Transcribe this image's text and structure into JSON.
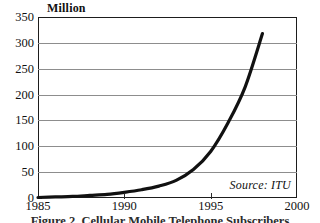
{
  "figure": {
    "unit_label": "Million",
    "source_note": "Source: ITU",
    "caption": "Figure 2. Cellular Mobile Telephone Subscribers"
  },
  "chart_data": {
    "type": "line",
    "title": "",
    "subtitle": "",
    "xlabel": "",
    "ylabel": "Million",
    "xlim": [
      1985,
      2000
    ],
    "ylim": [
      0,
      350
    ],
    "grid": true,
    "legend_position": "none",
    "annotations": [
      "Source: ITU"
    ],
    "x_ticks": [
      1985,
      1990,
      1995,
      2000
    ],
    "x_tick_labels": [
      "1985",
      "1990",
      "1995",
      "2000"
    ],
    "y_ticks": [
      0,
      50,
      100,
      150,
      200,
      250,
      300,
      350
    ],
    "y_tick_labels": [
      "0",
      "50",
      "100",
      "150",
      "200",
      "250",
      "300",
      "350"
    ],
    "series": [
      {
        "name": "Cellular mobile subscribers",
        "color": "#111111",
        "line_width": 3.2,
        "x": [
          1985,
          1986,
          1987,
          1988,
          1989,
          1990,
          1991,
          1992,
          1993,
          1994,
          1995,
          1996,
          1997,
          1998
        ],
        "values": [
          1,
          2,
          3,
          5,
          7,
          11,
          16,
          23,
          34,
          55,
          90,
          145,
          215,
          318
        ]
      }
    ]
  }
}
